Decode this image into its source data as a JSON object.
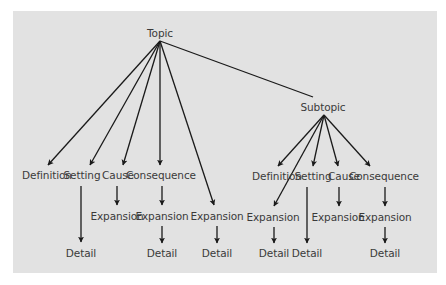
{
  "diagram": {
    "type": "tree",
    "colors": {
      "background": "#e2e2e2",
      "line": "#1a1a1a",
      "text": "#3a3a3a"
    },
    "nodes": {
      "topic": {
        "label": "Topic",
        "x": 160,
        "y": 33
      },
      "subtopic": {
        "label": "Subtopic",
        "x": 323,
        "y": 107
      },
      "t_definition": {
        "label": "Definition",
        "x": 47,
        "y": 175
      },
      "t_setting": {
        "label": "Setting",
        "x": 82,
        "y": 175
      },
      "t_cause": {
        "label": "Cause",
        "x": 118,
        "y": 175
      },
      "t_consequence": {
        "label": "Consequence",
        "x": 161,
        "y": 175
      },
      "t_cause_expansion": {
        "label": "Expansion",
        "x": 117,
        "y": 216
      },
      "t_consequence_expansion": {
        "label": "Expansion",
        "x": 162,
        "y": 216
      },
      "t_expansion": {
        "label": "Expansion",
        "x": 217,
        "y": 216
      },
      "t_setting_detail": {
        "label": "Detail",
        "x": 81,
        "y": 253
      },
      "t_consequence_detail": {
        "label": "Detail",
        "x": 162,
        "y": 253
      },
      "t_expansion_detail": {
        "label": "Detail",
        "x": 217,
        "y": 253
      },
      "s_definition": {
        "label": "Definition",
        "x": 277,
        "y": 176
      },
      "s_setting": {
        "label": "Setting",
        "x": 313,
        "y": 176
      },
      "s_cause": {
        "label": "Cause",
        "x": 344,
        "y": 176
      },
      "s_consequence": {
        "label": "Consequence",
        "x": 384,
        "y": 176
      },
      "s_expansion": {
        "label": "Expansion",
        "x": 273,
        "y": 217
      },
      "s_cause_expansion": {
        "label": "Expansion",
        "x": 338,
        "y": 217
      },
      "s_consequence_expansion": {
        "label": "Expansion",
        "x": 385,
        "y": 217
      },
      "s_expansion_detail": {
        "label": "Detail",
        "x": 274,
        "y": 253
      },
      "s_setting_detail": {
        "label": "Detail",
        "x": 307,
        "y": 253
      },
      "s_consequence_detail": {
        "label": "Detail",
        "x": 385,
        "y": 253
      }
    },
    "edges": [
      {
        "from": "topic",
        "to": "t_definition",
        "x1": 160,
        "y1": 41,
        "x2": 48,
        "y2": 165,
        "arrow": true
      },
      {
        "from": "topic",
        "to": "t_setting",
        "x1": 160,
        "y1": 41,
        "x2": 90,
        "y2": 165,
        "arrow": true
      },
      {
        "from": "topic",
        "to": "t_cause",
        "x1": 160,
        "y1": 41,
        "x2": 123,
        "y2": 165,
        "arrow": true
      },
      {
        "from": "topic",
        "to": "t_consequence",
        "x1": 160,
        "y1": 41,
        "x2": 160,
        "y2": 165,
        "arrow": true
      },
      {
        "from": "topic",
        "to": "t_expansion",
        "x1": 160,
        "y1": 41,
        "x2": 214,
        "y2": 205,
        "arrow": true
      },
      {
        "from": "topic",
        "to": "subtopic",
        "x1": 160,
        "y1": 41,
        "x2": 313,
        "y2": 97,
        "arrow": false
      },
      {
        "from": "t_setting",
        "to": "t_setting_detail",
        "x1": 81,
        "y1": 186,
        "x2": 81,
        "y2": 242,
        "arrow": true
      },
      {
        "from": "t_cause",
        "to": "t_cause_expansion",
        "x1": 117,
        "y1": 186,
        "x2": 117,
        "y2": 205,
        "arrow": true
      },
      {
        "from": "t_consequence",
        "to": "t_consequence_expansion",
        "x1": 162,
        "y1": 186,
        "x2": 162,
        "y2": 205,
        "arrow": true
      },
      {
        "from": "t_consequence_expansion",
        "to": "t_consequence_detail",
        "x1": 162,
        "y1": 226,
        "x2": 162,
        "y2": 243,
        "arrow": true
      },
      {
        "from": "t_expansion",
        "to": "t_expansion_detail",
        "x1": 217,
        "y1": 226,
        "x2": 217,
        "y2": 243,
        "arrow": true
      },
      {
        "from": "subtopic",
        "to": "s_definition",
        "x1": 324,
        "y1": 115,
        "x2": 278,
        "y2": 166,
        "arrow": true
      },
      {
        "from": "subtopic",
        "to": "s_expansion",
        "x1": 324,
        "y1": 115,
        "x2": 274,
        "y2": 206,
        "arrow": true
      },
      {
        "from": "subtopic",
        "to": "s_setting",
        "x1": 324,
        "y1": 115,
        "x2": 313,
        "y2": 166,
        "arrow": true
      },
      {
        "from": "subtopic",
        "to": "s_cause",
        "x1": 324,
        "y1": 115,
        "x2": 338,
        "y2": 166,
        "arrow": true
      },
      {
        "from": "subtopic",
        "to": "s_consequence",
        "x1": 324,
        "y1": 115,
        "x2": 370,
        "y2": 166,
        "arrow": true
      },
      {
        "from": "s_setting",
        "to": "s_setting_detail",
        "x1": 307,
        "y1": 187,
        "x2": 307,
        "y2": 243,
        "arrow": true
      },
      {
        "from": "s_cause",
        "to": "s_cause_expansion",
        "x1": 339,
        "y1": 187,
        "x2": 339,
        "y2": 206,
        "arrow": true
      },
      {
        "from": "s_consequence",
        "to": "s_consequence_expansion",
        "x1": 385,
        "y1": 187,
        "x2": 385,
        "y2": 206,
        "arrow": true
      },
      {
        "from": "s_expansion",
        "to": "s_expansion_detail",
        "x1": 274,
        "y1": 227,
        "x2": 274,
        "y2": 243,
        "arrow": true
      },
      {
        "from": "s_consequence_expansion",
        "to": "s_consequence_detail",
        "x1": 385,
        "y1": 227,
        "x2": 385,
        "y2": 243,
        "arrow": true
      }
    ]
  }
}
